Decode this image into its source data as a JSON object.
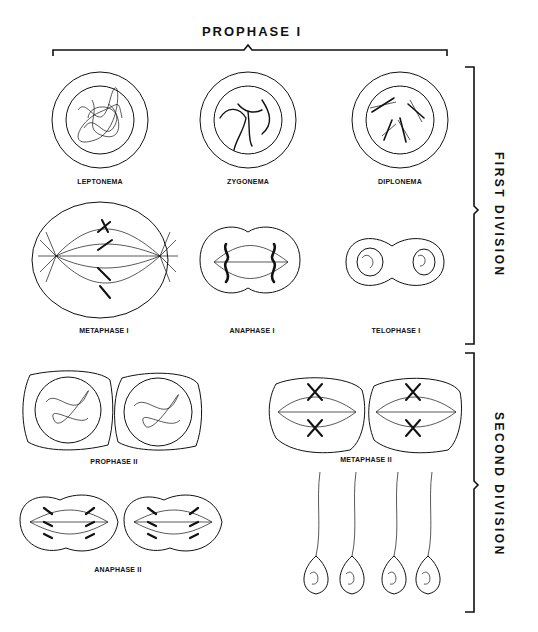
{
  "diagram": {
    "topic": "Stages of meiosis",
    "header": {
      "title": "PROPHASE I"
    },
    "divisions": [
      {
        "id": "first",
        "label": "FIRST DIVISION"
      },
      {
        "id": "second",
        "label": "SECOND DIVISION"
      }
    ],
    "stages": {
      "leptonema": "LEPTONEMA",
      "zygonema": "ZYGONEMA",
      "diplonema": "DIPLONEMA",
      "metaphase1": "METAPHASE I",
      "anaphase1": "ANAPHASE I",
      "telophase1": "TELOPHASE I",
      "prophase2": "PROPHASE II",
      "metaphase2": "METAPHASE II",
      "anaphase2": "ANAPHASE II"
    },
    "colors": {
      "ink": "#111111",
      "background": "#ffffff"
    }
  }
}
